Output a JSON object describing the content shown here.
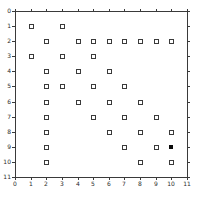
{
  "figure": {
    "background_color": "#ffffff",
    "axis_color": "#3a3a3a",
    "tick_label_color": "#2b2b2b"
  },
  "chart_data": {
    "type": "scatter",
    "title": "",
    "xlabel": "",
    "ylabel": "",
    "xlim": [
      0,
      11
    ],
    "ylim": [
      0,
      11
    ],
    "y_inverted": true,
    "grid": false,
    "legend": "none",
    "x_ticks": [
      0,
      1,
      2,
      3,
      4,
      5,
      6,
      7,
      8,
      9,
      10,
      11
    ],
    "y_ticks": [
      0,
      1,
      2,
      3,
      4,
      5,
      6,
      7,
      8,
      9,
      10,
      11
    ],
    "series": [
      {
        "name": "open-square-points",
        "marker": "open-square",
        "marker_edge_color": "#3a3a3a",
        "marker_face_color": "#ffffff",
        "points": [
          [
            1,
            1
          ],
          [
            3,
            1
          ],
          [
            2,
            2
          ],
          [
            4,
            2
          ],
          [
            5,
            2
          ],
          [
            6,
            2
          ],
          [
            7,
            2
          ],
          [
            8,
            2
          ],
          [
            9,
            2
          ],
          [
            10,
            2
          ],
          [
            1,
            3
          ],
          [
            3,
            3
          ],
          [
            5,
            3
          ],
          [
            2,
            4
          ],
          [
            4,
            4
          ],
          [
            6,
            4
          ],
          [
            2,
            5
          ],
          [
            3,
            5
          ],
          [
            5,
            5
          ],
          [
            7,
            5
          ],
          [
            2,
            6
          ],
          [
            4,
            6
          ],
          [
            6,
            6
          ],
          [
            8,
            6
          ],
          [
            2,
            7
          ],
          [
            5,
            7
          ],
          [
            7,
            7
          ],
          [
            9,
            7
          ],
          [
            2,
            8
          ],
          [
            6,
            8
          ],
          [
            8,
            8
          ],
          [
            10,
            8
          ],
          [
            2,
            9
          ],
          [
            7,
            9
          ],
          [
            9,
            9
          ],
          [
            2,
            10
          ],
          [
            8,
            10
          ],
          [
            10,
            10
          ]
        ]
      },
      {
        "name": "filled-square-point",
        "marker": "filled-square",
        "marker_face_color": "#0a0a0a",
        "points": [
          [
            10,
            9
          ]
        ]
      }
    ]
  }
}
